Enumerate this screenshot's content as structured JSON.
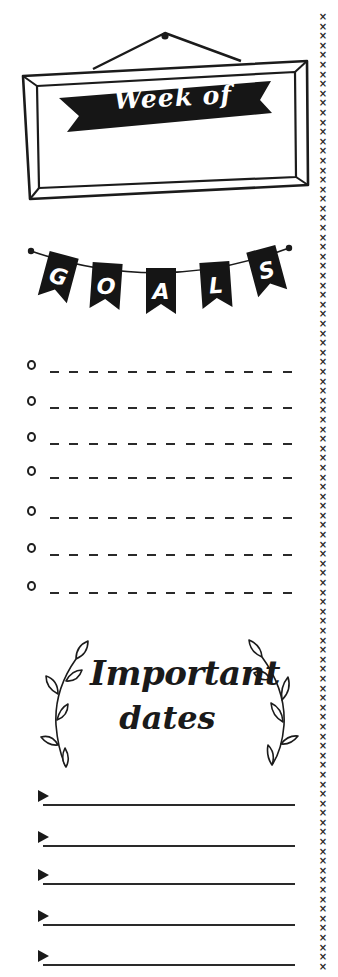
{
  "page": {
    "background": "#ffffff",
    "ink_color": "#1b1b1b"
  },
  "week_section": {
    "banner_label": "Week of",
    "frame_icon": "hanging-frame-icon",
    "banner_icon": "ribbon-banner-icon"
  },
  "goals_section": {
    "bunting_icon": "bunting-garland-icon",
    "bunting_letters": [
      "G",
      "O",
      "A",
      "L",
      "S"
    ],
    "title": "GOALS",
    "items": [
      {
        "bullet": "circle",
        "value": ""
      },
      {
        "bullet": "circle",
        "value": ""
      },
      {
        "bullet": "circle",
        "value": ""
      },
      {
        "bullet": "circle",
        "value": ""
      },
      {
        "bullet": "circle",
        "value": ""
      },
      {
        "bullet": "circle",
        "value": ""
      },
      {
        "bullet": "circle",
        "value": ""
      }
    ]
  },
  "dates_section": {
    "title_line1": "Important",
    "title_line2": "dates",
    "laurel_icon": "laurel-branch-icon",
    "items": [
      {
        "bullet": "triangle",
        "value": ""
      },
      {
        "bullet": "triangle",
        "value": ""
      },
      {
        "bullet": "triangle",
        "value": ""
      },
      {
        "bullet": "triangle",
        "value": ""
      },
      {
        "bullet": "triangle",
        "value": ""
      }
    ]
  },
  "border": {
    "stitch_glyph": "×",
    "stitch_count": 100
  }
}
